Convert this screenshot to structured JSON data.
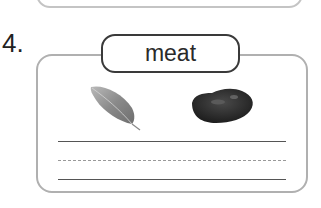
{
  "question": {
    "number": "4.",
    "word": "meat",
    "images": [
      {
        "name": "leaf",
        "description": "grey leaf photo"
      },
      {
        "name": "rock",
        "description": "dark rock / meat-like lump photo"
      }
    ],
    "writing_lines": [
      "solid",
      "dashed",
      "solid"
    ]
  }
}
